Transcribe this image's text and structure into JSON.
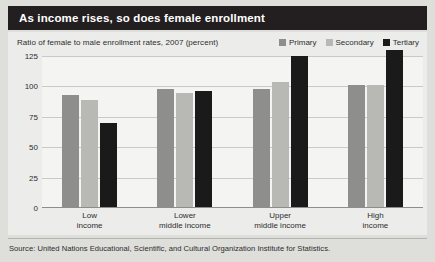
{
  "header": {
    "title": "As income rises, so does female enrollment"
  },
  "footer": {
    "source": "Source: United Nations Educational, Scientific, and Cultural Organization Institute for Statistics."
  },
  "colors": {
    "header_bar": "#231f20",
    "primary": "#8e8e8c",
    "secondary": "#b8b8b5",
    "tertiary": "#1a1a1a",
    "panel": "#ececeb",
    "plot": "#f4f4f3",
    "gridline": "#c9c9c7"
  },
  "chart_data": {
    "type": "bar",
    "title": "As income rises, so does female enrollment",
    "subtitle": "Ratio of female to male enrollment rates, 2007 (percent)",
    "xlabel": "",
    "ylabel": "",
    "ylim": [
      0,
      125
    ],
    "yticks": [
      0,
      25,
      50,
      75,
      100,
      125
    ],
    "ytick_labels": [
      "0",
      "25",
      "50",
      "75",
      "100",
      "125"
    ],
    "grid": true,
    "legend_position": "top-right",
    "categories": [
      "Low\nincome",
      "Lower\nmiddle income",
      "Upper\nmiddle income",
      "High\nincome"
    ],
    "category_lines": [
      [
        "Low",
        "income"
      ],
      [
        "Lower",
        "middle income"
      ],
      [
        "Upper",
        "middle income"
      ],
      [
        "High",
        "income"
      ]
    ],
    "series": [
      {
        "name": "Primary",
        "color": "#8e8e8c",
        "values": [
          92,
          97,
          97,
          100
        ]
      },
      {
        "name": "Secondary",
        "color": "#b8b8b5",
        "values": [
          88,
          94,
          103,
          100
        ]
      },
      {
        "name": "Tertiary",
        "color": "#1a1a1a",
        "values": [
          69,
          95,
          124,
          129
        ]
      }
    ]
  }
}
